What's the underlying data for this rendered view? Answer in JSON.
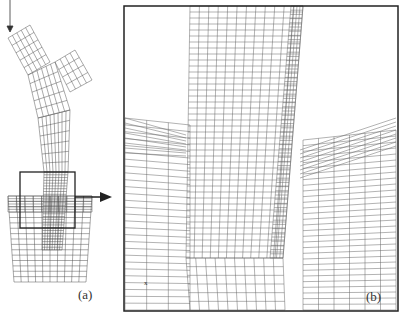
{
  "figure": {
    "panel_a_label": "(a)",
    "panel_b_label": "(b)",
    "axis_marker": "x",
    "line_color": "#444444",
    "frame_color": "#222222"
  }
}
